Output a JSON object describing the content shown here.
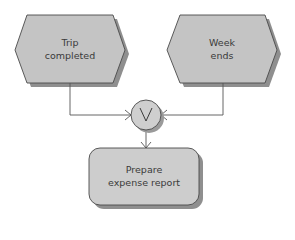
{
  "diagram": {
    "type": "event-driven process chain",
    "colors": {
      "fill": "#c4c4c4",
      "shadow": "#8f8f8f",
      "stroke": "#4a4a4a",
      "connector": "#555555",
      "text": "#3a3a3a"
    },
    "events": [
      {
        "id": "trip-completed",
        "line1": "Trip",
        "line2": "completed"
      },
      {
        "id": "week-ends",
        "line1": "Week",
        "line2": "ends"
      }
    ],
    "operator": {
      "id": "or-connector",
      "symbol": "V",
      "meaning": "OR"
    },
    "function": {
      "id": "prepare-expense-report",
      "line1": "Prepare",
      "line2": "expense report"
    },
    "edges": [
      {
        "from": "trip-completed",
        "to": "or-connector"
      },
      {
        "from": "week-ends",
        "to": "or-connector"
      },
      {
        "from": "or-connector",
        "to": "prepare-expense-report"
      }
    ]
  }
}
